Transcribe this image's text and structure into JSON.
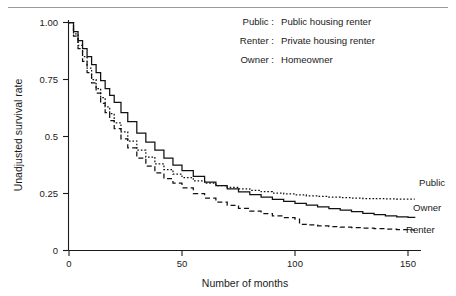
{
  "figure": {
    "top_rule": true
  },
  "legend": {
    "entries": [
      {
        "key": "Public :",
        "desc": "Public housing renter"
      },
      {
        "key": "Renter :",
        "desc": "Private housing renter"
      },
      {
        "key": "Owner :",
        "desc": "Homeowner"
      }
    ]
  },
  "curve_tags": [
    {
      "label": "Public"
    },
    {
      "label": "Owner"
    },
    {
      "label": "Renter"
    }
  ],
  "axes": {
    "y_label": "Unadjusted survival rate",
    "x_label": "Number of months",
    "y_ticks": [
      "1.00",
      "0.75",
      "0.5",
      "0.25",
      "0"
    ],
    "x_ticks": [
      "0",
      "50",
      "100",
      "150"
    ]
  },
  "chart_data": {
    "type": "line",
    "title": "",
    "subtitle": "",
    "xlabel": "Number of months",
    "ylabel": "Unadjusted survival rate",
    "xlim": [
      0,
      155
    ],
    "ylim": [
      0,
      1.0
    ],
    "xticks": [
      0,
      50,
      100,
      150
    ],
    "yticks": [
      0,
      0.25,
      0.5,
      0.75,
      1.0
    ],
    "ytick_labels": [
      "0",
      "0.25",
      "0.5",
      "0.75",
      "1.00"
    ],
    "grid": false,
    "legend_position": "top-right",
    "step_plot": true,
    "annotations": [
      {
        "text": "Public",
        "x": 153,
        "y": 0.225,
        "position": "right-of-curve"
      },
      {
        "text": "Owner",
        "x": 153,
        "y": 0.145,
        "position": "right-of-curve"
      },
      {
        "text": "Renter",
        "x": 153,
        "y": 0.085,
        "position": "right-of-curve"
      }
    ],
    "series": [
      {
        "name": "Public",
        "label": "Public housing renter",
        "style": "dotted",
        "color": "#111111",
        "x": [
          0,
          2,
          4,
          6,
          8,
          10,
          12,
          14,
          16,
          18,
          20,
          23,
          26,
          30,
          34,
          38,
          42,
          46,
          50,
          55,
          60,
          65,
          70,
          75,
          80,
          85,
          90,
          95,
          100,
          105,
          110,
          115,
          120,
          125,
          130,
          135,
          140,
          145,
          150,
          153
        ],
        "y": [
          1.0,
          0.95,
          0.9,
          0.85,
          0.8,
          0.75,
          0.71,
          0.67,
          0.63,
          0.6,
          0.56,
          0.52,
          0.48,
          0.44,
          0.41,
          0.38,
          0.355,
          0.335,
          0.32,
          0.305,
          0.295,
          0.285,
          0.277,
          0.27,
          0.264,
          0.258,
          0.252,
          0.248,
          0.244,
          0.24,
          0.237,
          0.234,
          0.232,
          0.23,
          0.228,
          0.227,
          0.226,
          0.225,
          0.225,
          0.225
        ]
      },
      {
        "name": "Owner",
        "label": "Homeowner",
        "style": "solid",
        "color": "#111111",
        "x": [
          0,
          2,
          4,
          6,
          8,
          10,
          12,
          14,
          16,
          18,
          20,
          23,
          26,
          30,
          34,
          38,
          42,
          46,
          50,
          55,
          60,
          65,
          70,
          75,
          80,
          85,
          90,
          95,
          100,
          105,
          110,
          115,
          120,
          125,
          130,
          135,
          140,
          145,
          150,
          153
        ],
        "y": [
          1.0,
          0.96,
          0.92,
          0.885,
          0.85,
          0.815,
          0.78,
          0.745,
          0.71,
          0.68,
          0.65,
          0.605,
          0.565,
          0.515,
          0.475,
          0.44,
          0.405,
          0.375,
          0.35,
          0.325,
          0.3,
          0.285,
          0.27,
          0.257,
          0.245,
          0.234,
          0.224,
          0.215,
          0.207,
          0.199,
          0.191,
          0.184,
          0.177,
          0.17,
          0.163,
          0.157,
          0.152,
          0.148,
          0.145,
          0.144
        ]
      },
      {
        "name": "Renter",
        "label": "Private housing renter",
        "style": "dashed",
        "color": "#111111",
        "x": [
          0,
          2,
          4,
          6,
          8,
          10,
          12,
          14,
          16,
          18,
          20,
          23,
          26,
          30,
          34,
          38,
          42,
          46,
          50,
          55,
          60,
          65,
          70,
          75,
          80,
          85,
          90,
          95,
          100,
          102,
          105,
          110,
          115,
          120,
          125,
          130,
          135,
          140,
          145,
          150,
          153
        ],
        "y": [
          1.0,
          0.94,
          0.885,
          0.83,
          0.78,
          0.735,
          0.69,
          0.645,
          0.605,
          0.57,
          0.535,
          0.49,
          0.45,
          0.405,
          0.37,
          0.34,
          0.315,
          0.295,
          0.275,
          0.25,
          0.23,
          0.212,
          0.198,
          0.185,
          0.173,
          0.162,
          0.152,
          0.144,
          0.138,
          0.115,
          0.112,
          0.108,
          0.105,
          0.102,
          0.1,
          0.098,
          0.096,
          0.094,
          0.092,
          0.09,
          0.09
        ]
      }
    ]
  }
}
